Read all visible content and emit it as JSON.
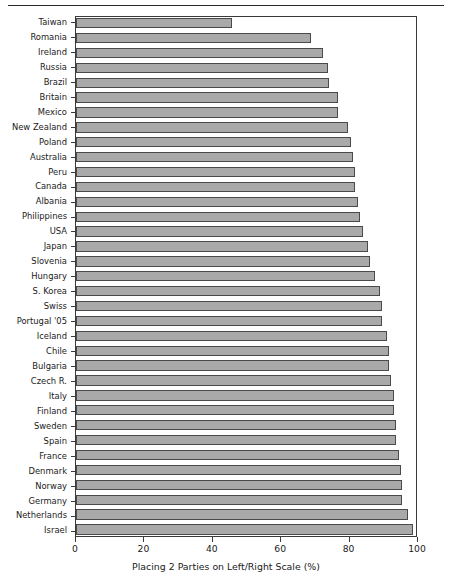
{
  "chart_data": {
    "type": "bar",
    "orientation": "horizontal",
    "title": "",
    "xlabel": "Placing 2 Parties on Left/Right Scale (%)",
    "ylabel": "",
    "xlim": [
      0,
      100
    ],
    "xticks": [
      0,
      20,
      40,
      60,
      80,
      100
    ],
    "grid": false,
    "legend": null,
    "bar_color": "#a9a9a9",
    "bar_edge_color": "#4a4a4a",
    "categories": [
      "Taiwan",
      "Romania",
      "Ireland",
      "Russia",
      "Brazil",
      "Britain",
      "Mexico",
      "New Zealand",
      "Poland",
      "Australia",
      "Peru",
      "Canada",
      "Albania",
      "Philippines",
      "USA",
      "Japan",
      "Slovenia",
      "Hungary",
      "S. Korea",
      "Swiss",
      "Portugal '05",
      "Iceland",
      "Chile",
      "Bulgaria",
      "Czech R.",
      "Italy",
      "Finland",
      "Sweden",
      "Spain",
      "France",
      "Denmark",
      "Norway",
      "Germany",
      "Netherlands",
      "Israel"
    ],
    "values": [
      46,
      69,
      72.5,
      74,
      74.5,
      77,
      77,
      80,
      81,
      81.5,
      82,
      82,
      83,
      83.5,
      84.5,
      86,
      86.5,
      88,
      89.5,
      90,
      90,
      91.5,
      92,
      92,
      92.5,
      93.5,
      93.5,
      94,
      94,
      95,
      95.5,
      96,
      96,
      97.5,
      99
    ]
  }
}
